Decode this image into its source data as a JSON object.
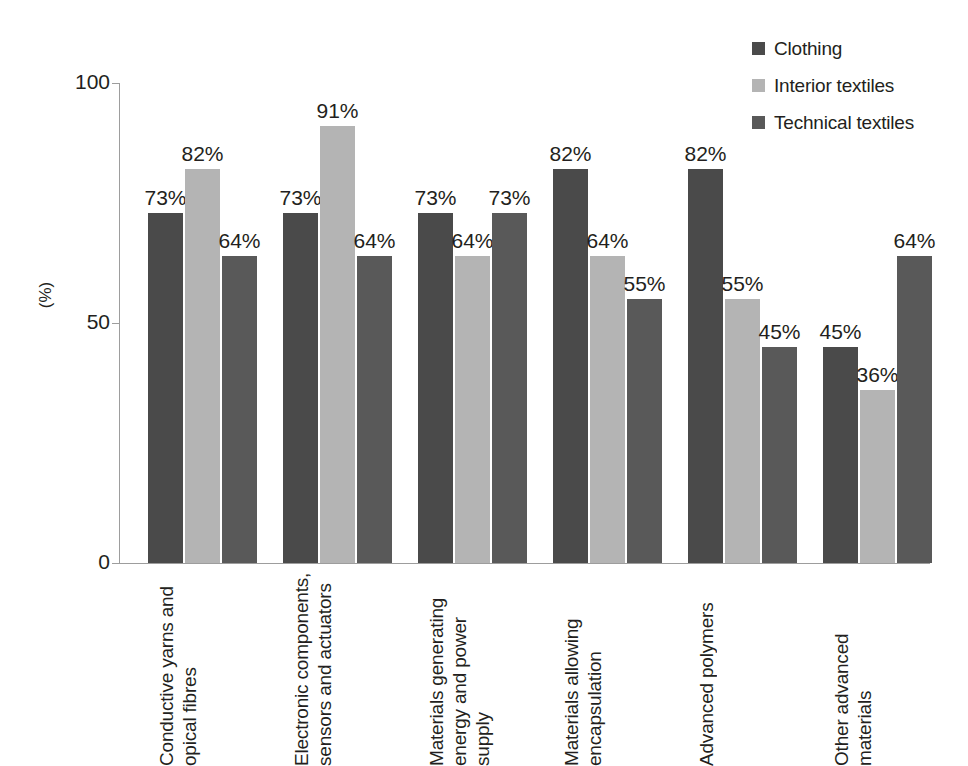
{
  "chart_data": {
    "type": "bar",
    "title": "",
    "xlabel": "",
    "ylabel": "(%)",
    "ylim": [
      0,
      100
    ],
    "yticks": [
      0,
      50,
      100
    ],
    "grid": false,
    "legend_position": "top-right",
    "categories": [
      "Conductive yarns and opical fibres",
      "Electronic components, sensors and actuators",
      "Materials generating energy and power supply",
      "Materials allowing encapsulation",
      "Advanced polymers",
      "Other advanced materials"
    ],
    "series": [
      {
        "name": "Clothing",
        "color": "#4a4a4a",
        "values": [
          73,
          73,
          73,
          82,
          82,
          45
        ],
        "labels": [
          "73%",
          "73%",
          "73%",
          "82%",
          "82%",
          "45%"
        ]
      },
      {
        "name": "Interior textiles",
        "color": "#b4b4b4",
        "values": [
          82,
          91,
          64,
          64,
          55,
          36
        ],
        "labels": [
          "82%",
          "91%",
          "64%",
          "64%",
          "55%",
          "36%"
        ]
      },
      {
        "name": "Technical textiles",
        "color": "#595959",
        "values": [
          64,
          64,
          73,
          55,
          45,
          64
        ],
        "labels": [
          "64%",
          "64%",
          "73%",
          "55%",
          "45%",
          "64%"
        ]
      }
    ]
  },
  "axis": {
    "y_title": "(%)",
    "tick_labels": [
      "100",
      "50",
      "0"
    ]
  },
  "legend": {
    "items": [
      {
        "label": "Clothing",
        "color": "#4a4a4a"
      },
      {
        "label": "Interior textiles",
        "color": "#b4b4b4"
      },
      {
        "label": "Technical textiles",
        "color": "#595959"
      }
    ]
  }
}
